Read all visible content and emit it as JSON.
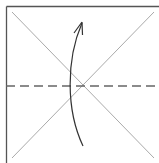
{
  "diagram": {
    "type": "origami-fold-step",
    "colors": {
      "border": "#555555",
      "crease": "#aaaaaa",
      "fold_line": "#666666",
      "arrow": "#333333",
      "background": "#ffffff"
    },
    "elements": {
      "square": "paper-square",
      "creases": [
        "diagonal-crease-1",
        "diagonal-crease-2"
      ],
      "fold_line": "valley-fold-horizontal",
      "arrow": "fold-up-arrow"
    }
  }
}
